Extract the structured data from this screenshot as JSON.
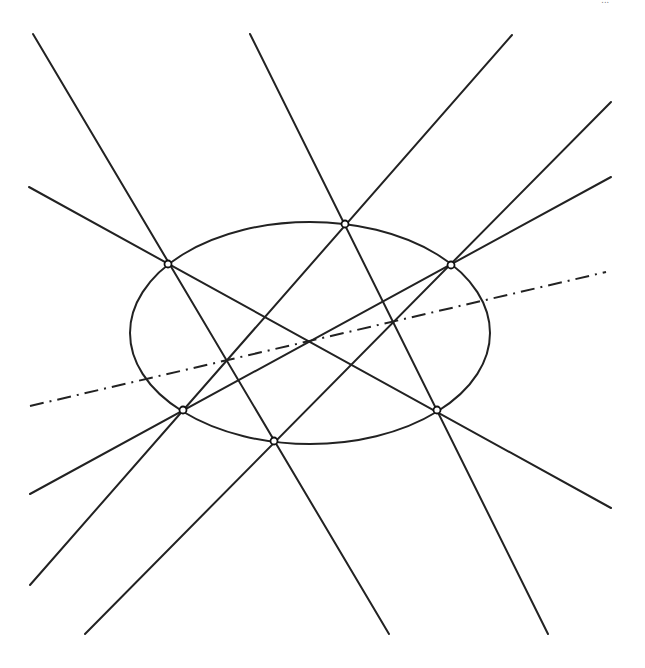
{
  "diagram": {
    "caption": "...",
    "ellipse": {
      "cx": 310,
      "cy": 333,
      "rx": 180,
      "ry": 111
    },
    "points": [
      {
        "name": "P1",
        "x": 168,
        "y": 264
      },
      {
        "name": "P2",
        "x": 345,
        "y": 224
      },
      {
        "name": "P3",
        "x": 451,
        "y": 265
      },
      {
        "name": "P4",
        "x": 437,
        "y": 410
      },
      {
        "name": "P5",
        "x": 274,
        "y": 441
      },
      {
        "name": "P6",
        "x": 183,
        "y": 410
      }
    ],
    "lines": [
      {
        "name": "line-1",
        "x1": 33,
        "y1": 34,
        "x2": 389,
        "y2": 634
      },
      {
        "name": "line-2",
        "x1": 250,
        "y1": 34,
        "x2": 548,
        "y2": 634
      },
      {
        "name": "line-3",
        "x1": 29,
        "y1": 187,
        "x2": 611,
        "y2": 508
      },
      {
        "name": "line-4",
        "x1": 512,
        "y1": 35,
        "x2": 30,
        "y2": 585
      },
      {
        "name": "line-5",
        "x1": 611,
        "y1": 102,
        "x2": 85,
        "y2": 634
      },
      {
        "name": "line-6",
        "x1": 611,
        "y1": 177,
        "x2": 30,
        "y2": 494
      }
    ],
    "pascal_line": {
      "x1": 30,
      "y1": 406,
      "x2": 606,
      "y2": 272,
      "style": "dash-dot"
    },
    "colors": {
      "stroke": "#222222",
      "background": "#ffffff",
      "point_fill": "#ffffff"
    }
  }
}
